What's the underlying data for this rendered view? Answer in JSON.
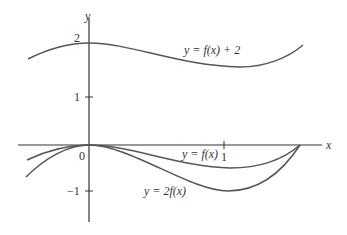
{
  "figure": {
    "axis_labels": {
      "x": "x",
      "y": "y"
    },
    "ticks": {
      "y2": "2",
      "y1": "1",
      "y0": "0",
      "ym1": "−1",
      "x1": "1"
    },
    "curve_labels": {
      "shifted": "y = f(x) + 2",
      "base": "y = f(x)",
      "scaled": "y = 2f(x)"
    },
    "colors": {
      "axis": "#333333",
      "curve": "#555555",
      "text": "#333333"
    }
  }
}
